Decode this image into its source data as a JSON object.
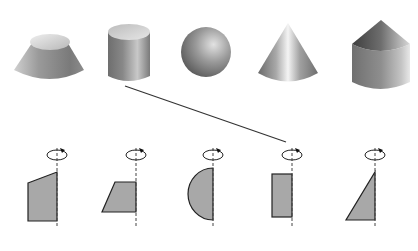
{
  "diagram": {
    "colors": {
      "background": "#ffffff",
      "shape_fill": "#a8a8a8",
      "shape_stroke": "#222222",
      "axis": "#444444",
      "connector": "#333333"
    },
    "solids": [
      {
        "id": "frustum",
        "label": "truncated-cone"
      },
      {
        "id": "cylinder",
        "label": "cylinder"
      },
      {
        "id": "sphere",
        "label": "sphere"
      },
      {
        "id": "cone",
        "label": "cone"
      },
      {
        "id": "cylinder-with-cone",
        "label": "cylinder-topped-with-cone"
      }
    ],
    "plane_figures": [
      {
        "id": "pentagon",
        "label": "rectangle-with-slanted-top"
      },
      {
        "id": "trapezoid",
        "label": "trapezoid"
      },
      {
        "id": "semicircle",
        "label": "semicircle"
      },
      {
        "id": "rectangle",
        "label": "rectangle"
      },
      {
        "id": "right-triangle",
        "label": "right-triangle"
      }
    ],
    "connections": [
      {
        "from": "cylinder",
        "to": "rectangle"
      }
    ],
    "rotation_symbol": "rotation-arrow"
  }
}
